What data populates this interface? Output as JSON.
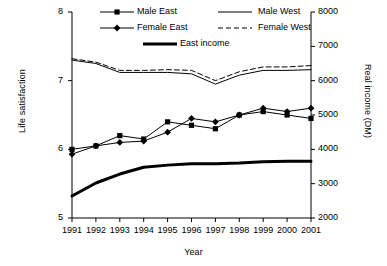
{
  "chart_data": {
    "type": "line",
    "title": "",
    "xlabel": "Year",
    "ylabel": "Life satisfaction",
    "y2label": "Real income (DM)",
    "x": [
      1991,
      1992,
      1993,
      1994,
      1995,
      1996,
      1997,
      1998,
      1999,
      2000,
      2001
    ],
    "xtick_labels": [
      "1991",
      "1992",
      "1993",
      "1994",
      "1995",
      "1996",
      "1997",
      "1998",
      "1999",
      "2000",
      "2001"
    ],
    "ylim": [
      5,
      8
    ],
    "ytick_labels": [
      "5",
      "6",
      "7",
      "8"
    ],
    "ytick_values": [
      5,
      6,
      7,
      8
    ],
    "y2lim": [
      2000,
      8000
    ],
    "y2tick_labels": [
      "2000",
      "3000",
      "4000",
      "5000",
      "6000",
      "7000",
      "8000"
    ],
    "y2tick_values": [
      2000,
      3000,
      4000,
      5000,
      6000,
      7000,
      8000
    ],
    "grid": false,
    "legend_position": "top",
    "series": [
      {
        "name": "Male East",
        "axis": "left",
        "marker": "square",
        "line_style": "solid",
        "line_width": 1,
        "values": [
          6.0,
          6.05,
          6.2,
          6.15,
          6.4,
          6.35,
          6.3,
          6.5,
          6.55,
          6.5,
          6.45
        ]
      },
      {
        "name": "Female East",
        "axis": "left",
        "marker": "diamond",
        "line_style": "solid",
        "line_width": 1,
        "values": [
          5.93,
          6.05,
          6.1,
          6.12,
          6.25,
          6.45,
          6.4,
          6.5,
          6.6,
          6.55,
          6.6
        ]
      },
      {
        "name": "Male West",
        "axis": "left",
        "marker": "none",
        "line_style": "solid",
        "line_width": 1,
        "values": [
          7.3,
          7.25,
          7.12,
          7.12,
          7.12,
          7.1,
          6.95,
          7.08,
          7.15,
          7.15,
          7.16
        ]
      },
      {
        "name": "Female West",
        "axis": "left",
        "marker": "none",
        "line_style": "dashed",
        "line_width": 1,
        "values": [
          7.32,
          7.27,
          7.15,
          7.15,
          7.16,
          7.15,
          7.0,
          7.13,
          7.2,
          7.2,
          7.22
        ]
      },
      {
        "name": "East income",
        "axis": "right",
        "marker": "none",
        "line_style": "solid",
        "line_width": 3,
        "values": [
          2640,
          3020,
          3280,
          3480,
          3540,
          3580,
          3580,
          3600,
          3640,
          3650,
          3650
        ]
      }
    ]
  },
  "legend": {
    "entries": [
      {
        "label": "Male East",
        "key": "male-east"
      },
      {
        "label": "Male West",
        "key": "male-west"
      },
      {
        "label": "Female East",
        "key": "female-east"
      },
      {
        "label": "Female West",
        "key": "female-west"
      },
      {
        "label": "East income",
        "key": "east-income"
      }
    ]
  },
  "colors": {
    "line": "#000000",
    "axis": "#000000",
    "background": "#ffffff"
  }
}
